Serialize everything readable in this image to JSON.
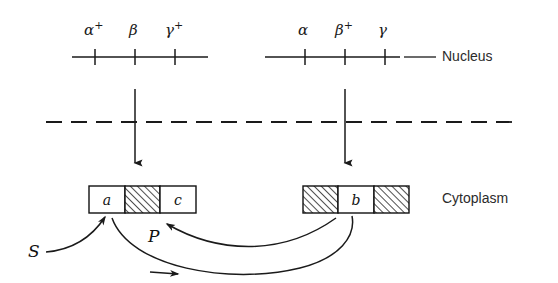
{
  "figure": {
    "compartments": [
      {
        "name": "nucleus",
        "label": "Nucleus"
      },
      {
        "name": "cytoplasm",
        "label": "Cytoplasm"
      }
    ],
    "chromosomes": [
      {
        "id": "left",
        "loci": [
          {
            "gene": "alpha",
            "glyph": "α",
            "superscript": "+",
            "state": "wild-type"
          },
          {
            "gene": "beta",
            "glyph": "β",
            "superscript": "",
            "state": "mutant"
          },
          {
            "gene": "gamma",
            "glyph": "γ",
            "superscript": "+",
            "state": "wild-type"
          }
        ]
      },
      {
        "id": "right",
        "loci": [
          {
            "gene": "alpha",
            "glyph": "α",
            "superscript": "",
            "state": "mutant"
          },
          {
            "gene": "beta",
            "glyph": "β",
            "superscript": "+",
            "state": "wild-type"
          },
          {
            "gene": "gamma",
            "glyph": "γ",
            "superscript": "",
            "state": "mutant"
          }
        ]
      }
    ],
    "products": [
      {
        "id": "left-product",
        "segments": [
          {
            "label": "a",
            "fill": "open"
          },
          {
            "label": "",
            "fill": "hatched"
          },
          {
            "label": "c",
            "fill": "open"
          }
        ]
      },
      {
        "id": "right-product",
        "segments": [
          {
            "label": "",
            "fill": "hatched"
          },
          {
            "label": "b",
            "fill": "open"
          },
          {
            "label": "",
            "fill": "hatched"
          }
        ]
      }
    ],
    "factors": [
      {
        "id": "substrate",
        "label": "S"
      },
      {
        "id": "precursor",
        "label": "P"
      }
    ],
    "colors": {
      "ink": "#1a1a1a",
      "label_ink": "#2b2b2b",
      "paper": "#ffffff",
      "hatch": "#222222"
    }
  }
}
